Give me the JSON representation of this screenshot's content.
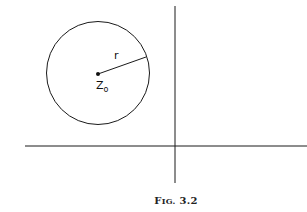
{
  "figure": {
    "caption_prefix": "F",
    "caption_smallcaps": "IG.",
    "caption_number": "3.2",
    "labels": {
      "radius": "r",
      "center": "Z",
      "center_subscript": "o"
    },
    "colors": {
      "stroke": "#1a1a1a",
      "background": "#ffffff"
    },
    "geometry": {
      "circle": {
        "cx": 98,
        "cy": 73,
        "r": 51
      },
      "radius_end": {
        "x": 146,
        "y": 57
      },
      "vertical_axis_x": 175,
      "horizontal_axis_y": 146
    }
  }
}
